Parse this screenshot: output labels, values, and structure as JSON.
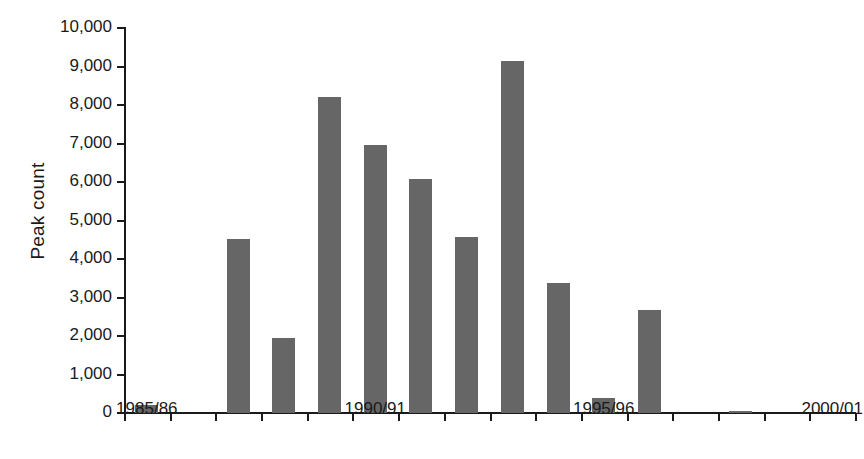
{
  "chart_data": {
    "type": "bar",
    "title": "",
    "xlabel": "",
    "ylabel": "Peak count",
    "ylim": [
      0,
      10000
    ],
    "ytick_step": 1000,
    "yticks": [
      "0",
      "1,000",
      "2,000",
      "3,000",
      "4,000",
      "5,000",
      "6,000",
      "7,000",
      "8,000",
      "9,000",
      "10,000"
    ],
    "ytick_values": [
      0,
      1000,
      2000,
      3000,
      4000,
      5000,
      6000,
      7000,
      8000,
      9000,
      10000
    ],
    "grid": false,
    "legend": "none",
    "bar_color": "#666666",
    "axis_color": "#1a1a1a",
    "background": "#ffffff",
    "xtick_count": 17,
    "xtick_labels": [
      {
        "index": 0,
        "label": "1985/86"
      },
      {
        "index": 5,
        "label": "1990/91"
      },
      {
        "index": 10,
        "label": "1995/96"
      },
      {
        "index": 15,
        "label": "2000/01"
      }
    ],
    "categories": [
      "1985/86",
      "1986/87",
      "1987/88",
      "1988/89",
      "1989/90",
      "1990/91",
      "1991/92",
      "1992/93",
      "1993/94",
      "1994/95",
      "1995/96",
      "1996/97",
      "1997/98",
      "1998/99",
      "1999/00",
      "2000/01"
    ],
    "values": [
      220,
      0,
      4510,
      1960,
      8200,
      6950,
      6080,
      4570,
      9150,
      3380,
      400,
      2680,
      0,
      50,
      0,
      0
    ]
  },
  "axis": {
    "y_title": "Peak count"
  }
}
